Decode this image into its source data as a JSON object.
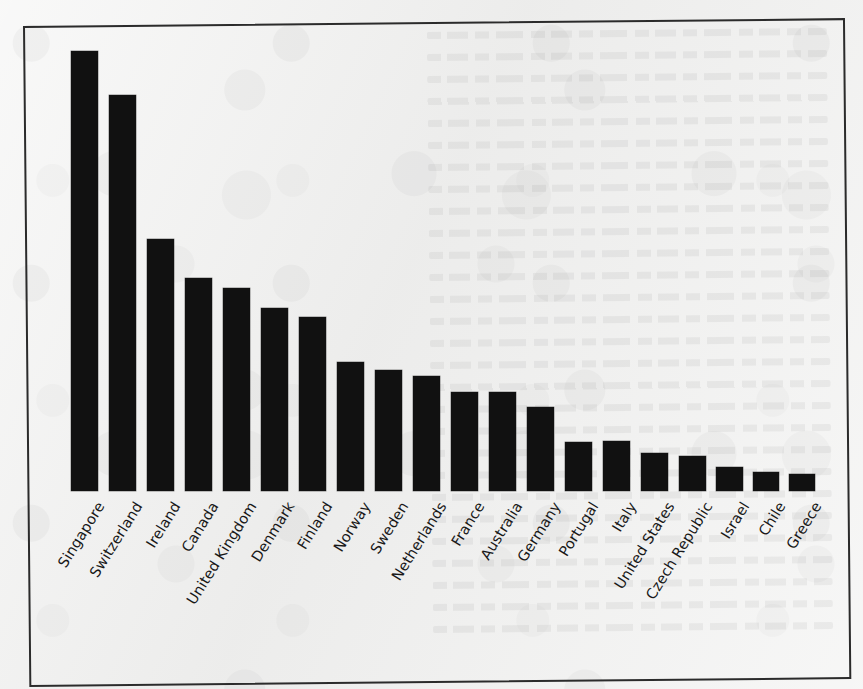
{
  "figure": {
    "kind": "scanned-page-bar-chart",
    "background_color": "#f1f1f0",
    "bar_color": "#111111",
    "frame_color": "#2b2b2b",
    "label_color": "#181818",
    "label_rotation_degrees": -58
  },
  "chart_data": {
    "type": "bar",
    "title": "",
    "subtitle": "",
    "xlabel": "",
    "ylabel": "",
    "grid": false,
    "legend": false,
    "axis_tick_labels_visible": false,
    "ylim": [
      0,
      100
    ],
    "categories": [
      "Singapore",
      "Switzerland",
      "Ireland",
      "Canada",
      "United Kingdom",
      "Denmark",
      "Finland",
      "Norway",
      "Sweden",
      "Netherlands",
      "France",
      "Australia",
      "Germany",
      "Portugal",
      "Italy",
      "United States",
      "Czech Republic",
      "Israel",
      "Chile",
      "Greece"
    ],
    "values": [
      100.0,
      90.0,
      57.3,
      48.4,
      46.1,
      41.6,
      39.5,
      29.3,
      27.5,
      26.1,
      22.5,
      22.5,
      19.1,
      11.1,
      11.4,
      8.6,
      7.9,
      5.5,
      4.3,
      3.9
    ]
  },
  "bars": [
    {
      "label": "Singapore",
      "value": 100.0,
      "x": 71,
      "top": 51,
      "width": 27
    },
    {
      "label": "Switzerland",
      "value": 90.0,
      "x": 109,
      "top": 95,
      "width": 27
    },
    {
      "label": "Ireland",
      "value": 57.3,
      "x": 147,
      "top": 239,
      "width": 27
    },
    {
      "label": "Canada",
      "value": 48.4,
      "x": 185,
      "top": 278,
      "width": 27
    },
    {
      "label": "United Kingdom",
      "value": 46.1,
      "x": 223,
      "top": 288,
      "width": 27
    },
    {
      "label": "Denmark",
      "value": 41.6,
      "x": 261,
      "top": 308,
      "width": 27
    },
    {
      "label": "Finland",
      "value": 39.5,
      "x": 299,
      "top": 317,
      "width": 27
    },
    {
      "label": "Norway",
      "value": 29.3,
      "x": 337,
      "top": 362,
      "width": 27
    },
    {
      "label": "Sweden",
      "value": 27.5,
      "x": 375,
      "top": 370,
      "width": 27
    },
    {
      "label": "Netherlands",
      "value": 26.1,
      "x": 413,
      "top": 376,
      "width": 27
    },
    {
      "label": "France",
      "value": 22.5,
      "x": 451,
      "top": 392,
      "width": 27
    },
    {
      "label": "Australia",
      "value": 22.5,
      "x": 489,
      "top": 392,
      "width": 27
    },
    {
      "label": "Germany",
      "value": 19.1,
      "x": 527,
      "top": 407,
      "width": 27
    },
    {
      "label": "Portugal",
      "value": 11.1,
      "x": 565,
      "top": 442,
      "width": 27
    },
    {
      "label": "Italy",
      "value": 11.4,
      "x": 603,
      "top": 441,
      "width": 27
    },
    {
      "label": "United States",
      "value": 8.6,
      "x": 641,
      "top": 453,
      "width": 27
    },
    {
      "label": "Czech Republic",
      "value": 7.9,
      "x": 679,
      "top": 456,
      "width": 27
    },
    {
      "label": "Israel",
      "value": 5.5,
      "x": 716,
      "top": 467,
      "width": 27
    },
    {
      "label": "Chile",
      "value": 4.3,
      "x": 753,
      "top": 472,
      "width": 26
    },
    {
      "label": "Greece",
      "value": 3.9,
      "x": 789,
      "top": 474,
      "width": 26
    }
  ],
  "baseline_y": 491
}
